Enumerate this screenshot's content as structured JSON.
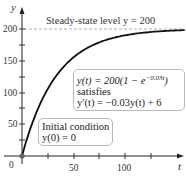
{
  "chart_data": {
    "type": "line",
    "title": "",
    "xlabel": "t",
    "ylabel": "y",
    "x_ticks": [
      0,
      50,
      100
    ],
    "y_ticks": [
      50,
      100,
      150,
      200
    ],
    "xlim": [
      0,
      145
    ],
    "ylim": [
      0,
      215
    ],
    "grid": false,
    "series": [
      {
        "name": "y(t) = 200(1 - e^(-0.03t))",
        "x": [
          0,
          5,
          10,
          15,
          20,
          25,
          30,
          40,
          50,
          60,
          70,
          80,
          90,
          100,
          110,
          120,
          130,
          140
        ],
        "values": [
          0,
          27.9,
          51.8,
          72.4,
          90.2,
          105.5,
          118.7,
          139.8,
          155.4,
          167.0,
          175.5,
          181.9,
          186.6,
          190.0,
          192.6,
          194.5,
          196.0,
          197.0
        ]
      }
    ],
    "reference_lines": [
      {
        "axis": "y",
        "value": 200,
        "style": "dashed",
        "label": "Steady-state level y = 200"
      }
    ],
    "annotations": [
      {
        "text": "Steady-state level y = 200"
      },
      {
        "text": [
          "y(t) = 200(1 − e^{−0.03t})",
          "satisfies",
          "y′(t) = −0.03y(t) + 6"
        ]
      },
      {
        "text": [
          "Initial condition",
          "y(0) = 0"
        ]
      }
    ],
    "points": [
      {
        "x": 0,
        "y": 0,
        "label": "initial point"
      }
    ]
  },
  "labels": {
    "y_axis": "y",
    "x_axis": "t",
    "origin": "0",
    "y200": "200",
    "y150": "150",
    "y100": "100",
    "y50": "50",
    "x50": "50",
    "x100": "100",
    "steady_state": "Steady-state level y = 200",
    "formula_line1_a": "y(t) = 200(1 − e",
    "formula_line1_exp": "−0.03t",
    "formula_line1_b": ")",
    "formula_line2": "satisfies",
    "formula_line3": "y′(t) = −0.03y(t) + 6",
    "init_line1": "Initial condition",
    "init_line2": "y(0) = 0"
  }
}
